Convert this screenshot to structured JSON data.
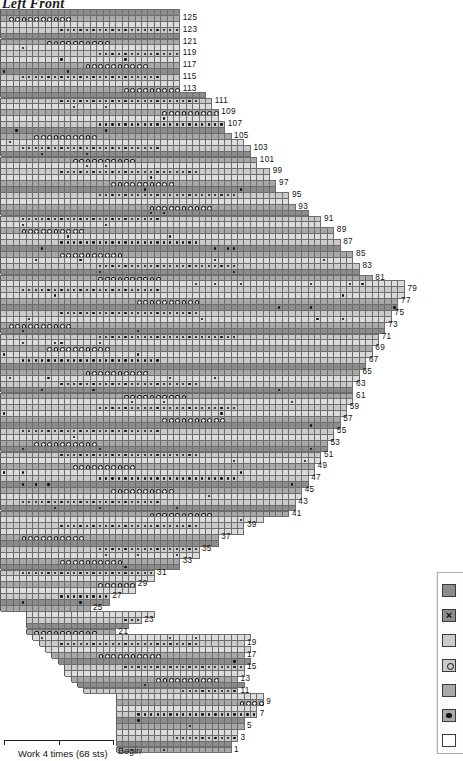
{
  "title": "Left Front",
  "chart_data": {
    "type": "table",
    "title": "Left Front",
    "row_count": 126,
    "row_labels": [
      1,
      3,
      5,
      7,
      9,
      11,
      13,
      15,
      17,
      19,
      21,
      23,
      25,
      27,
      29,
      31,
      33,
      35,
      37,
      39,
      41,
      43,
      45,
      47,
      49,
      51,
      53,
      55,
      57,
      59,
      61,
      63,
      65,
      67,
      69,
      71,
      73,
      75,
      77,
      79,
      81,
      83,
      85,
      87,
      89,
      91,
      93,
      95,
      97,
      99,
      101,
      103,
      105,
      107,
      109,
      111,
      113,
      115,
      117,
      119,
      121,
      123,
      125
    ],
    "stitch_repeat": {
      "label": "Work 4 times (68 sts)",
      "times": 4,
      "stitches": 68
    },
    "begin_label": "Begin",
    "cell_width_px": 6.42,
    "cell_height_px": 5.9,
    "repeat_line_x_px": [
      98,
      293
    ],
    "colors": {
      "dark": "#8c8c8c",
      "medium": "#a8a8a8",
      "light": "#cacaca",
      "pale": "#dcdcdc",
      "white": "#f2f2f2",
      "gridline": "#6d6d6d",
      "symbol": "#111111"
    }
  },
  "legend": {
    "items": [
      {
        "name": "swatch-dark-plain",
        "color": "dark",
        "symbol": "none"
      },
      {
        "name": "swatch-dark-cross",
        "color": "dark",
        "symbol": "cross"
      },
      {
        "name": "swatch-light-plain",
        "color": "light",
        "symbol": "none"
      },
      {
        "name": "swatch-light-circle",
        "color": "light",
        "symbol": "circle"
      },
      {
        "name": "swatch-medium-plain",
        "color": "medium",
        "symbol": "none"
      },
      {
        "name": "swatch-medium-dot",
        "color": "medium",
        "symbol": "dot"
      },
      {
        "name": "swatch-white-plain",
        "color": "white",
        "symbol": "none"
      }
    ]
  },
  "annotations": {
    "repeat_bracket_label": "Work 4 times (68 sts)",
    "begin": "Begin"
  }
}
